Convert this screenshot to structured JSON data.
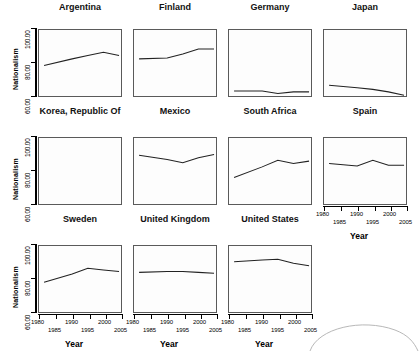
{
  "figure": {
    "axis_titles": {
      "y": "Nationalism",
      "x": "Year"
    },
    "y_ticks": [
      "100.00",
      "80.00",
      "60.00"
    ],
    "y_tick_values": [
      100,
      80,
      60
    ],
    "x_ticks_upper": [
      "1980",
      "1990",
      "2000"
    ],
    "x_ticks_lower": [
      "1985",
      "1995",
      "2005"
    ],
    "line_color": "#222222",
    "frame_color": "#5a5a5a",
    "panel_bg": "#fdfdfd"
  },
  "chart_data": {
    "type": "line",
    "title": "",
    "xlabel": "Year",
    "ylabel": "Nationalism",
    "xlim": [
      1980,
      2005
    ],
    "ylim": [
      60,
      100
    ],
    "grid": false,
    "legend": "none",
    "x": [
      1981,
      1990,
      1995,
      2000,
      2005
    ],
    "panels": [
      {
        "name": "Argentina",
        "row": 0,
        "col": 0,
        "values": [
          78.5,
          82.5,
          84.5,
          86.5,
          84.5
        ]
      },
      {
        "name": "Finland",
        "row": 0,
        "col": 1,
        "values": [
          82.5,
          83.0,
          85.5,
          88.5,
          88.5
        ]
      },
      {
        "name": "Germany",
        "row": 0,
        "col": 2,
        "values": [
          63.0,
          63.0,
          61.5,
          62.5,
          62.5
        ]
      },
      {
        "name": "Japan",
        "row": 0,
        "col": 3,
        "values": [
          66.5,
          65.0,
          64.0,
          62.5,
          60.5
        ]
      },
      {
        "name": "Korea, Republic Of",
        "row": 1,
        "col": 0,
        "values": [
          87.0,
          85.0,
          81.0,
          76.0,
          77.5
        ]
      },
      {
        "name": "Mexico",
        "row": 1,
        "col": 1,
        "values": [
          89.5,
          87.0,
          85.0,
          88.0,
          90.0
        ]
      },
      {
        "name": "South Africa",
        "row": 1,
        "col": 2,
        "values": [
          76.0,
          82.5,
          86.5,
          84.5,
          86.0
        ]
      },
      {
        "name": "Spain",
        "row": 1,
        "col": 3,
        "values": [
          84.5,
          83.0,
          86.5,
          83.5,
          83.5
        ]
      },
      {
        "name": "Sweden",
        "row": 2,
        "col": 0,
        "values": [
          78.0,
          83.0,
          86.5,
          85.5,
          84.5
        ]
      },
      {
        "name": "United Kingdom",
        "row": 2,
        "col": 1,
        "values": [
          84.0,
          84.5,
          84.5,
          84.0,
          83.5
        ]
      },
      {
        "name": "United States",
        "row": 2,
        "col": 2,
        "values": [
          90.5,
          91.5,
          92.0,
          89.5,
          88.0
        ]
      }
    ]
  }
}
